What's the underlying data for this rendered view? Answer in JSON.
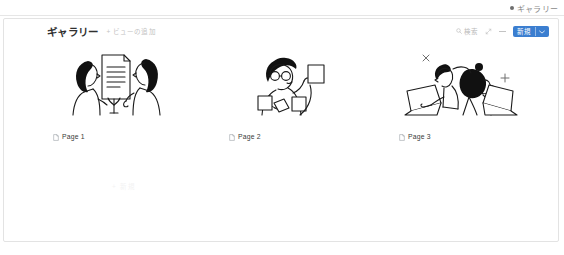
{
  "tabstrip": {
    "tab_label": "ギャラリー",
    "dot_icon": "record-dot-icon"
  },
  "header": {
    "title": "ギャラリー",
    "add_view_label": "+ ビューの追加",
    "search_label": "検索",
    "search_icon": "search-icon",
    "sort_icon": "sort-arrows-icon",
    "filter_icon": "dash-icon",
    "new_button_label": "新規",
    "new_button_chevron": "chevron-down-icon",
    "accent_color": "#3b7ed0"
  },
  "gallery": {
    "cards": [
      {
        "label": "Page 1",
        "icon": "document-icon",
        "art": "two-people-reviewing-document-illustration"
      },
      {
        "label": "Page 2",
        "icon": "document-icon",
        "art": "person-with-glasses-holding-cards-illustration"
      },
      {
        "label": "Page 3",
        "icon": "document-icon",
        "art": "two-people-at-laptops-illustration"
      }
    ]
  },
  "body": {
    "add_hint": "+ 新規"
  }
}
